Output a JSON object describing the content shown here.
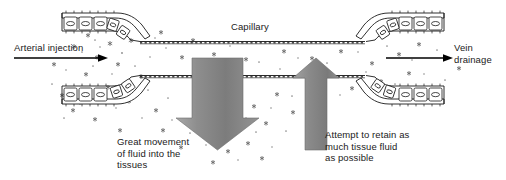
{
  "diagram": {
    "width": 506,
    "height": 180,
    "background_color": "#ffffff",
    "ink_color": "#1a1a1a"
  },
  "labels": {
    "capillary": "Capillary",
    "arterial_injection": "Arterial injection",
    "vein_drainage": "Vein\ndrainage",
    "great_movement": "Great movement\nof fluid into the\ntissues",
    "attempt_retain": "Attempt to retain as\nmuch tissue fluid\nas possible"
  },
  "arrows": {
    "arterial_flow": {
      "name": "arterial-flow-arrow",
      "direction": "right",
      "style": "thin-black-line",
      "color": "#000000"
    },
    "vein_flow": {
      "name": "vein-flow-arrow",
      "direction": "right",
      "style": "thin-black-line",
      "color": "#000000"
    },
    "fluid_out": {
      "name": "fluid-out-arrow",
      "direction": "down",
      "style": "large-gray-block",
      "color": "#8c8c8c",
      "meaning": "Great movement of fluid into the tissues"
    },
    "fluid_retained": {
      "name": "fluid-retained-arrow",
      "direction": "up",
      "style": "narrow-gray-block",
      "color": "#8c8c8c",
      "meaning": "Attempt to retain as much tissue fluid as possible"
    }
  },
  "structures": {
    "capillary_tube": {
      "name": "capillary-tube",
      "description": "narrow beaded double-walled tube spanning the centre"
    },
    "vessel_walls": [
      {
        "name": "vessel-wall-top-left",
        "cells": 5,
        "position": "upper-left"
      },
      {
        "name": "vessel-wall-bottom-left",
        "cells": 5,
        "position": "lower-left"
      },
      {
        "name": "vessel-wall-top-right",
        "cells": 5,
        "position": "upper-right"
      },
      {
        "name": "vessel-wall-bottom-right",
        "cells": 5,
        "position": "lower-right"
      }
    ],
    "tissue_fluid_particles": {
      "name": "tissue-fluid-particles",
      "description": "scattered star and dot marks representing tissue fluid"
    }
  }
}
